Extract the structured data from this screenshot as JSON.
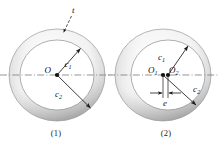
{
  "figure": {
    "background_color": "#ffffff",
    "ring_fill_light": "#fdfdfd",
    "ring_fill_mid": "#d8d8d8",
    "ring_fill_dark": "#b4b4b4",
    "line_color": "#1a1a1a",
    "centerline_color": "#7a7a7a"
  },
  "panels": [
    {
      "id": "panel-1",
      "caption": "(1)",
      "type": "concentric-annulus",
      "center_label": "O",
      "labels": {
        "inner_radius": "c",
        "inner_radius_sub": "1",
        "outer_radius": "c",
        "outer_radius_sub": "2",
        "thickness": "t"
      },
      "geometry": {
        "cx": 57,
        "cy": 75,
        "outer_rx": 48,
        "outer_ry": 46,
        "inner_rx": 37,
        "inner_ry": 35
      }
    },
    {
      "id": "panel-2",
      "caption": "(2)",
      "type": "eccentric-annulus",
      "center_label_1": "O",
      "center_label_1_sub": "1",
      "center_label_2": "O",
      "center_label_2_sub": "2",
      "labels": {
        "inner_radius": "c",
        "inner_radius_sub": "1",
        "outer_radius": "c",
        "outer_radius_sub": "2",
        "eccentricity": "e"
      },
      "geometry": {
        "outer_cx": 163,
        "outer_cy": 75,
        "inner_cx": 168,
        "inner_cy": 75,
        "outer_rx": 48,
        "outer_ry": 46,
        "inner_rx": 37,
        "inner_ry": 35,
        "eccentricity_px": 5
      }
    }
  ]
}
